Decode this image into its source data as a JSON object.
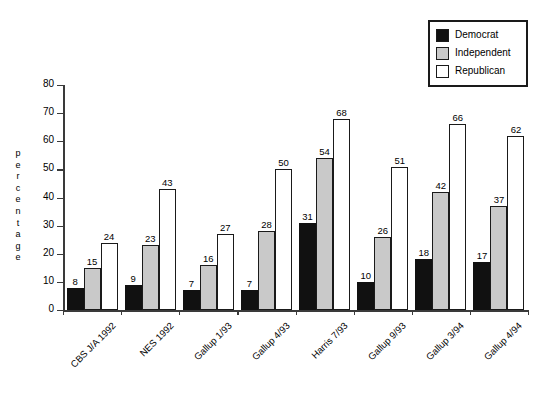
{
  "chart_data": {
    "type": "bar",
    "title": "",
    "xlabel": "",
    "ylabel": "percentage",
    "ylim": [
      0,
      80
    ],
    "yticks": [
      0,
      10,
      20,
      30,
      40,
      50,
      60,
      70,
      80
    ],
    "grid": false,
    "legend_position": "top-right",
    "categories": [
      "CBS J/A 1992",
      "NES 1992",
      "Gallup 1/93",
      "Gallup 4/93",
      "Harris 7/93",
      "Gallup 9/93",
      "Gallup 3/94",
      "Gallup 4/94"
    ],
    "series": [
      {
        "name": "Democrat",
        "color": "#111111",
        "values": [
          8,
          9,
          7,
          7,
          31,
          10,
          18,
          17
        ]
      },
      {
        "name": "Independent",
        "color": "#c9c9c9",
        "values": [
          15,
          23,
          16,
          28,
          54,
          26,
          42,
          37
        ]
      },
      {
        "name": "Republican",
        "color": "#ffffff",
        "values": [
          24,
          43,
          27,
          50,
          68,
          51,
          66,
          62
        ]
      }
    ]
  },
  "legend": {
    "items": [
      {
        "label": "Democrat",
        "swatch": "#111111"
      },
      {
        "label": "Independent",
        "swatch": "#c9c9c9"
      },
      {
        "label": "Republican",
        "swatch": "#ffffff"
      }
    ]
  },
  "axis": {
    "y_label_text": "percentage"
  }
}
